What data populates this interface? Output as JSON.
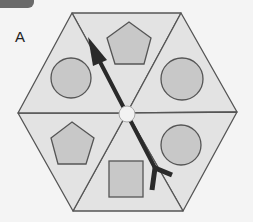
{
  "figure": {
    "label": "A",
    "colors": {
      "background": "#f4f4f4",
      "triangle_fill": "#e3e3e3",
      "shape_fill": "#c8c8c8",
      "stroke": "#555555",
      "arrow": "#2a2a2a",
      "center_dot": "#f2f2f2",
      "tab": "#6a6a6a"
    },
    "segments": [
      {
        "position": "top",
        "shape": "pentagon"
      },
      {
        "position": "upper-right",
        "shape": "circle"
      },
      {
        "position": "lower-right",
        "shape": "circle"
      },
      {
        "position": "bottom",
        "shape": "square"
      },
      {
        "position": "lower-left",
        "shape": "pentagon"
      },
      {
        "position": "upper-left",
        "shape": "circle"
      }
    ],
    "arrow": {
      "direction": "from lower-right to upper-left through center"
    }
  }
}
